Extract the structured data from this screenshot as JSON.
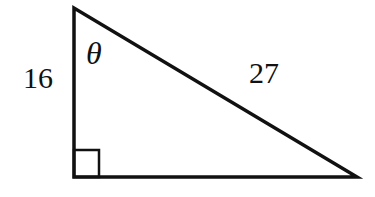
{
  "diagram": {
    "type": "right-triangle",
    "colors": {
      "stroke": "#111111",
      "background": "#ffffff"
    },
    "vertices": {
      "top": [
        74,
        8
      ],
      "right_angle": [
        74,
        177
      ],
      "bottom_right": [
        357,
        177
      ]
    },
    "right_angle_marker": {
      "x": 74,
      "y": 150,
      "size": 25
    },
    "labels": {
      "vertical_leg": "16",
      "hypotenuse": "27",
      "angle": "θ"
    }
  }
}
